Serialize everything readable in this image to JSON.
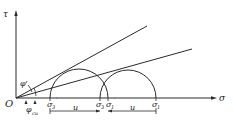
{
  "diagram": {
    "type": "mohr-circle",
    "axes": {
      "x_label": "σ",
      "y_label": "τ",
      "origin_label": "O"
    },
    "angles": {
      "upper": "φ'",
      "lower_base": "φ",
      "lower_sub": "cu"
    },
    "points": {
      "sigma3_prime": {
        "base": "σ",
        "sub": "3",
        "sup": "'"
      },
      "sigma3": {
        "base": "σ",
        "sub": "3"
      },
      "sigma1_prime": {
        "base": "σ",
        "sub": "1",
        "sup": "'"
      },
      "sigma1": {
        "base": "σ",
        "sub": "1"
      }
    },
    "dimension_labels": {
      "u_left": "u",
      "u_right": "u"
    },
    "stroke_color": "#2a2a2a"
  }
}
